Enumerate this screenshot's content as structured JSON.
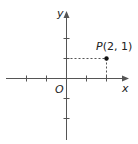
{
  "diagram": {
    "type": "cartesian-plane",
    "x_axis_label": "x",
    "y_axis_label": "y",
    "origin_label": "O",
    "x_ticks": [
      -3,
      -2,
      -1,
      1,
      2
    ],
    "y_ticks": [
      2,
      1,
      -1,
      -2
    ],
    "point": {
      "name": "P",
      "x": 2,
      "y": 1,
      "label": "P(2, 1)",
      "label_name": "P",
      "label_coords": "(2, 1)"
    },
    "colors": {
      "axis": "#555555",
      "point": "#111111",
      "text": "#222222"
    }
  }
}
